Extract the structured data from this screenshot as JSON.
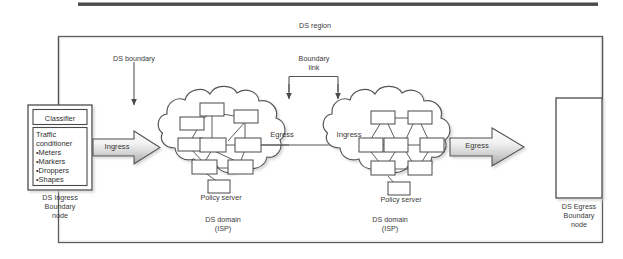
{
  "figure": {
    "type": "network-diagram",
    "title_label": "DS region",
    "background": "#ffffff",
    "frame_color": "#5a5a5a",
    "line_color": "#555555",
    "text_color": "#3a3a3a"
  },
  "top_bar": {
    "present": true,
    "color": "#4a4a4a"
  },
  "labels": {
    "ds_region": "DS region",
    "ds_boundary": "DS boundary",
    "boundary_link_line1": "Boundary",
    "boundary_link_line2": "link",
    "ingress_left": "Ingress",
    "egress_middle": "Egress",
    "ingress_right": "Ingress",
    "egress_right": "Egress",
    "policy_server": "Policy server",
    "ds_domain_line1": "DS domain",
    "ds_domain_line2": "(ISP)"
  },
  "ingress_node": {
    "classifier_label": "Classifier",
    "conditioner_line1": "Traffic",
    "conditioner_line2": "conditioner",
    "conditioner_items": [
      "•Meters",
      "•Markers",
      "•Droppers",
      "•Shapes"
    ],
    "caption_line1": "DS Ingress",
    "caption_line2": "Boundary",
    "caption_line3": "node"
  },
  "egress_node": {
    "caption_line1": "DS Egress",
    "caption_line2": "Boundary",
    "caption_line3": "node"
  },
  "clouds": [
    {
      "name": "ds-domain-left",
      "domain_label": "DS domain",
      "isp_label": "(ISP)",
      "policy_server_label": "Policy server"
    },
    {
      "name": "ds-domain-right",
      "domain_label": "DS domain",
      "isp_label": "(ISP)",
      "policy_server_label": "Policy server"
    }
  ],
  "arrows": {
    "ingress_block_arrow": "Ingress",
    "egress_block_arrow": "Egress"
  }
}
